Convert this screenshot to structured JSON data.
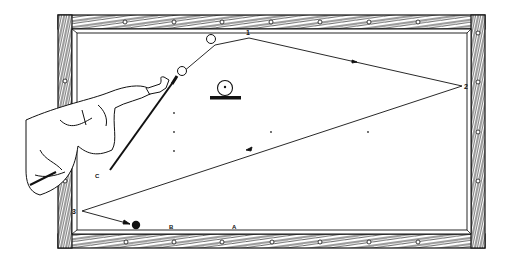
{
  "illustration": {
    "subject": "billiard-table-three-cushion-shot",
    "colors": {
      "ink": "#1a1a1a",
      "paper": "#ffffff",
      "wood": "#2a2a2a"
    },
    "cushion_points": [
      {
        "id": "1",
        "label": "1"
      },
      {
        "id": "2",
        "label": "2"
      },
      {
        "id": "3",
        "label": "3"
      }
    ],
    "spots": [
      {
        "id": "A",
        "label": "A"
      },
      {
        "id": "B",
        "label": "B"
      },
      {
        "id": "C",
        "label": "C"
      }
    ]
  }
}
